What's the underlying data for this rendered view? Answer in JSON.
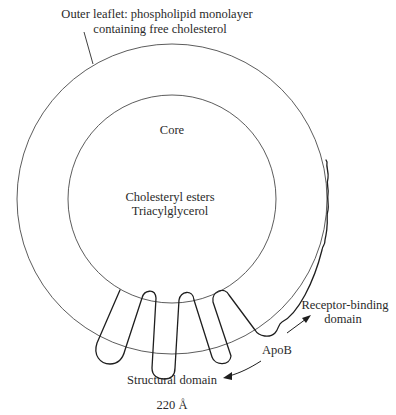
{
  "figure": {
    "labels": {
      "outer_leaflet_line1": "Outer leaflet: phospholipid monolayer",
      "outer_leaflet_line2": "containing free cholesterol",
      "core": "Core",
      "core_contents_line1": "Cholesteryl esters",
      "core_contents_line2": "Triacylglycerol",
      "receptor_binding_line1": "Receptor-binding",
      "receptor_binding_line2": "domain",
      "apob": "ApoB",
      "structural_domain": "Structural domain",
      "diameter": "220 Å"
    },
    "geometry": {
      "center_x": 172,
      "center_y": 199,
      "outer_radius": 155,
      "inner_radius": 104
    },
    "colors": {
      "background": "#ffffff",
      "line": "#1e1e1e",
      "text": "#2a2a2a"
    }
  }
}
